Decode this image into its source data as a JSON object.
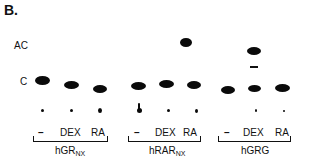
{
  "figure": {
    "panel_label": "B.",
    "row_labels": {
      "acetylated": "AC",
      "unacetylated": "C"
    },
    "groups": [
      {
        "name": "hGR",
        "subscript": "NX",
        "lanes": [
          "–",
          "DEX",
          "RA"
        ]
      },
      {
        "name": "hRAR",
        "subscript": "NX",
        "lanes": [
          "–",
          "DEX",
          "RA"
        ]
      },
      {
        "name": "hGRG",
        "subscript": "",
        "lanes": [
          "–",
          "DEX",
          "RA"
        ]
      }
    ],
    "spot_color": "#0a0a0a",
    "background_color": "#ffffff"
  }
}
